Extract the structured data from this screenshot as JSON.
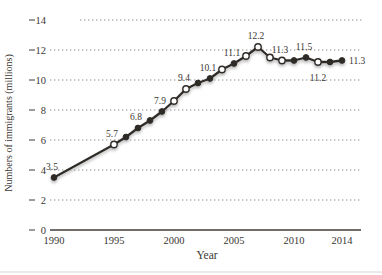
{
  "figure": {
    "background": "#ffffff"
  },
  "chart_data": {
    "type": "line",
    "title": "",
    "xlabel": "Year",
    "ylabel": "Numbers of immigrants (millions)",
    "xlim": [
      1990,
      2014
    ],
    "ylim": [
      0,
      14
    ],
    "y_ticks": [
      0,
      2,
      4,
      6,
      8,
      10,
      12,
      14
    ],
    "x_ticks": [
      1990,
      1995,
      2000,
      2005,
      2010,
      2014
    ],
    "grid": "horizontal-dotted",
    "legend": "none",
    "series": [
      {
        "name": "Number of immigrants (millions)",
        "x": [
          1990,
          1995,
          1996,
          1997,
          1998,
          1999,
          2000,
          2001,
          2002,
          2003,
          2004,
          2005,
          2006,
          2007,
          2008,
          2009,
          2010,
          2011,
          2012,
          2013,
          2014
        ],
        "y": [
          3.5,
          5.7,
          6.2,
          6.8,
          7.3,
          7.9,
          8.6,
          9.4,
          9.8,
          10.1,
          10.7,
          11.1,
          11.6,
          12.2,
          11.5,
          11.3,
          11.3,
          11.5,
          11.2,
          11.2,
          11.3
        ],
        "marker_open": [
          false,
          true,
          false,
          false,
          false,
          false,
          true,
          true,
          false,
          false,
          true,
          false,
          true,
          true,
          true,
          true,
          false,
          false,
          true,
          false,
          false
        ],
        "point_labels": [
          {
            "x": 1990,
            "text": "3.5",
            "position": "above"
          },
          {
            "x": 1995,
            "text": "5.7",
            "position": "above"
          },
          {
            "x": 1997,
            "text": "6.8",
            "position": "above"
          },
          {
            "x": 1999,
            "text": "7.9",
            "position": "above"
          },
          {
            "x": 2001,
            "text": "9.4",
            "position": "above"
          },
          {
            "x": 2003,
            "text": "10.1",
            "position": "above"
          },
          {
            "x": 2005,
            "text": "11.1",
            "position": "above"
          },
          {
            "x": 2007,
            "text": "12.2",
            "position": "above"
          },
          {
            "x": 2009,
            "text": "11.3",
            "position": "above"
          },
          {
            "x": 2011,
            "text": "11.5",
            "position": "above"
          },
          {
            "x": 2012,
            "text": "11.2",
            "position": "below"
          },
          {
            "x": 2014,
            "text": "11.3",
            "position": "right"
          }
        ]
      }
    ],
    "colors": {
      "line": "#2e2a26",
      "marker_fill": "#2e2a26",
      "marker_open_fill": "#ffffff",
      "grid": "#8f8f8f",
      "axis": "#3f3b37",
      "text": "#3a3632",
      "glow": "#9a9a9a",
      "page_rule": "#d4d4d4"
    }
  }
}
